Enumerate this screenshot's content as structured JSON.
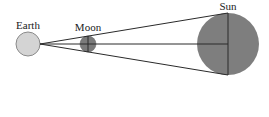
{
  "diagram": {
    "labels": {
      "earth": "Earth",
      "moon": "Moon",
      "sun": "Sun"
    },
    "colors": {
      "earth_fill": "#d4d4d4",
      "earth_stroke": "#8a8a8a",
      "moon_fill": "#7a7a7a",
      "sun_fill": "#7e7e7e",
      "line": "#2a2a2a",
      "background": "#ffffff"
    }
  }
}
